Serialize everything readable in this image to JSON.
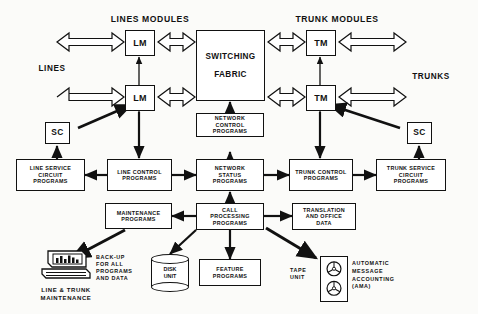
{
  "diagram": {
    "labels": {
      "lines_modules": "LINES MODULES",
      "trunk_modules": "TRUNK MODULES",
      "lines": "LINES",
      "trunks": "TRUNKS",
      "backup": "BACK-UP\nFOR ALL\nPROGRAMS\nAND DATA",
      "tape_unit": "TAPE\nUNIT",
      "ama": "AUTOMATIC\nMESSAGE\nACCOUNTING\n(AMA)",
      "line_trunk_maintenance": "LINE & TRUNK\nMAINTENANCE"
    },
    "nodes": {
      "lm_top": "LM",
      "lm_bottom": "LM",
      "tm_top": "TM",
      "tm_bottom": "TM",
      "switching_fabric_1": "SWITCHING",
      "switching_fabric_2": "FABRIC",
      "sc_left": "SC",
      "sc_right": "SC",
      "network_control": "NETWORK\nCONTROL\nPROGRAMS",
      "network_status": "NETWORK\nSTATUS\nPROGRAMS",
      "line_service_circuit": "LINE SERVICE\nCIRCUIT\nPROGRAMS",
      "line_control": "LINE CONTROL\nPROGRAMS",
      "trunk_control": "TRUNK CONTROL\nPROGRAMS",
      "trunk_service_circuit": "TRUNK SERVICE\nCIRCUIT\nPROGRAMS",
      "maintenance": "MAINTENANCE\nPROGRAMS",
      "call_processing": "CALL\nPROCESSING\nPROGRAMS",
      "translation_office": "TRANSLATION\nAND OFFICE\nDATA",
      "feature": "FEATURE\nPROGRAMS",
      "disk_unit": "DISK\nUNIT"
    },
    "colors": {
      "stroke": "#111111",
      "fill": "#ffffff",
      "background": "#fbfbf9"
    }
  }
}
